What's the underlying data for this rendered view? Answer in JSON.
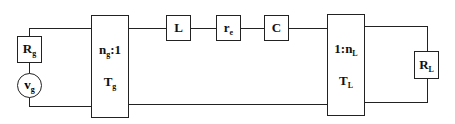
{
  "diagram": {
    "type": "circuit",
    "components": {
      "source_resistor": {
        "main": "R",
        "sub": "g"
      },
      "source_voltage": {
        "main": "v",
        "sub": "g"
      },
      "transformer_g": {
        "ratio_main": "n",
        "ratio_sub": "g",
        "ratio_suffix": ":1",
        "name_main": "T",
        "name_sub": "g"
      },
      "inductor": {
        "main": "L"
      },
      "resistor_e": {
        "main": "r",
        "sub": "e"
      },
      "capacitor": {
        "main": "C"
      },
      "transformer_l": {
        "ratio_prefix": "1:n",
        "ratio_sub": "L",
        "name_main": "T",
        "name_sub": "L"
      },
      "load_resistor": {
        "main": "R",
        "sub": "L"
      }
    },
    "connections": [
      "vg - Rg - Tg primary",
      "Tg secondary - L - re - C - TL primary",
      "TL secondary - RL"
    ],
    "colors": {
      "line": "#222222",
      "background": "#ffffff"
    }
  }
}
